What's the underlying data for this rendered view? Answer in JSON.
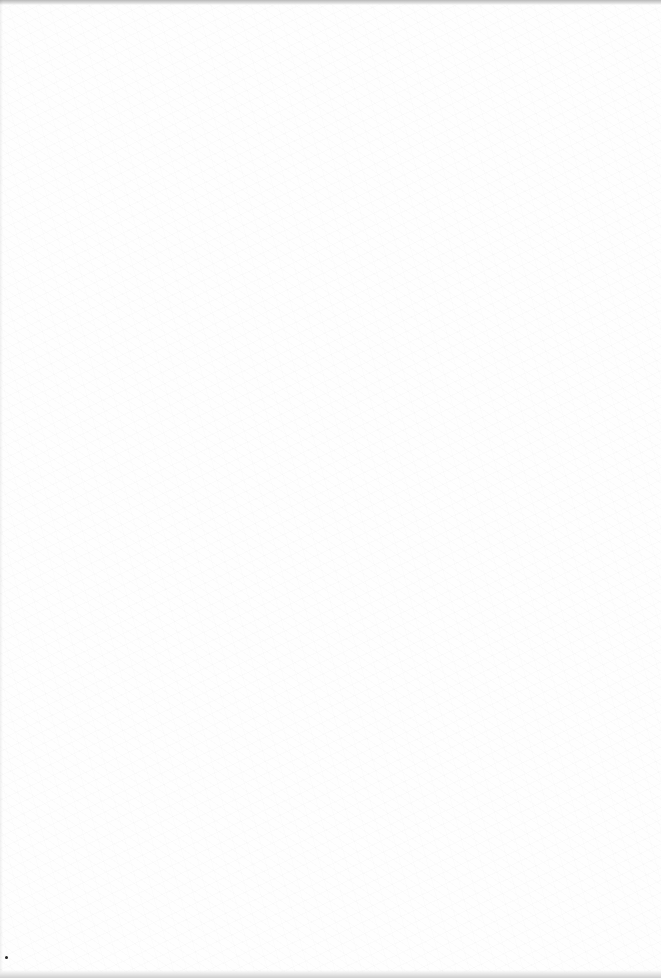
{
  "document": {
    "type": "blank scanned page",
    "text": "",
    "background_color": "#fefefe",
    "edge_color": "#b8b8b8"
  }
}
